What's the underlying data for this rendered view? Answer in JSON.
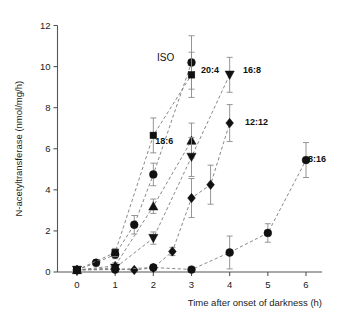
{
  "chart_data": {
    "type": "line",
    "title": "",
    "xlabel": "Time after onset of darkness (h)",
    "ylabel": "N-acetyltransferase (nmol/mg/h)",
    "xlim": [
      0,
      6.4
    ],
    "ylim": [
      0,
      12
    ],
    "xticks": [
      0,
      1,
      2,
      3,
      4,
      5,
      6
    ],
    "xtick_labels": [
      "0",
      "1",
      "2",
      "3",
      "4",
      "5",
      "6"
    ],
    "yticks": [
      0,
      2,
      4,
      6,
      8,
      10,
      12
    ],
    "ytick_labels": [
      "0",
      "2",
      "4",
      "6",
      "8",
      "10",
      "12"
    ],
    "grid": false,
    "legend_position": "inline-annotations",
    "series": [
      {
        "name": "ISO",
        "label": "ISO",
        "marker": "circle",
        "label_x": 2.55,
        "label_y": 10.45,
        "x": [
          0,
          0.5,
          1,
          1.5,
          2,
          3
        ],
        "values": [
          0.1,
          0.45,
          0.85,
          2.3,
          4.75,
          10.2
        ],
        "errors": [
          0.1,
          0.15,
          0.2,
          0.45,
          0.55,
          1.3
        ]
      },
      {
        "name": "20:4",
        "label": "20:4",
        "marker": "square",
        "label_x": 3.25,
        "label_y": 9.85,
        "x": [
          0,
          1,
          2,
          3
        ],
        "values": [
          0.1,
          0.95,
          6.65,
          9.6
        ],
        "errors": [
          0.1,
          0.2,
          0.85,
          1.1
        ]
      },
      {
        "name": "18:6",
        "label": "18:6",
        "marker": "triangle-up",
        "label_x": 2.52,
        "label_y": 6.4,
        "x": [
          0,
          1,
          2,
          3
        ],
        "values": [
          0.1,
          0.3,
          3.2,
          6.4
        ],
        "errors": [
          0.1,
          0.15,
          0.35,
          0.85
        ]
      },
      {
        "name": "16:8",
        "label": "16:8",
        "marker": "triangle-down",
        "label_x": 4.35,
        "label_y": 9.85,
        "x": [
          0,
          1,
          2,
          3,
          4
        ],
        "values": [
          0.1,
          0.2,
          1.65,
          5.6,
          9.6
        ],
        "errors": [
          0.1,
          0.1,
          0.3,
          0.95,
          0.85
        ]
      },
      {
        "name": "12:12",
        "label": "12:12",
        "marker": "diamond",
        "label_x": 4.4,
        "label_y": 7.3,
        "x": [
          0,
          1,
          1.5,
          2,
          2.5,
          3,
          3.5,
          4
        ],
        "values": [
          0.1,
          0.15,
          0.1,
          0.2,
          1.0,
          3.6,
          4.25,
          7.25
        ],
        "errors": [
          0.1,
          0.08,
          0.08,
          0.1,
          0.2,
          0.95,
          0.95,
          0.9
        ]
      },
      {
        "name": "8:16",
        "label": "8:16",
        "marker": "circle",
        "label_x": 6.05,
        "label_y": 5.5,
        "x": [
          0,
          1,
          2,
          3,
          4,
          5,
          6
        ],
        "values": [
          0.1,
          0.12,
          0.22,
          0.12,
          0.95,
          1.9,
          5.45
        ],
        "errors": [
          0.1,
          0.08,
          0.1,
          0.08,
          0.8,
          0.45,
          0.85
        ]
      }
    ]
  }
}
